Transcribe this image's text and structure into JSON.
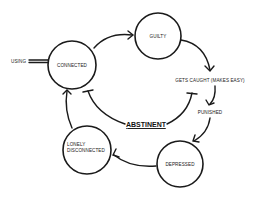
{
  "diagram": {
    "nodes": [
      {
        "id": "connected",
        "label": "CONNECTED",
        "shape": "circle"
      },
      {
        "id": "guilty",
        "label": "GUILTY",
        "shape": "circle"
      },
      {
        "id": "gets_caught",
        "label": "GETS CAUGHT (MAKES EASY)",
        "shape": "text"
      },
      {
        "id": "punished",
        "label": "PUNISHED",
        "shape": "text"
      },
      {
        "id": "depressed",
        "label": "DEPRESSED",
        "shape": "circle"
      },
      {
        "id": "lonely",
        "label_line1": "LONELY",
        "label_line2": "DISCONNECTED",
        "shape": "circle"
      }
    ],
    "center_label": "ABSTINENT",
    "input_label": "USING",
    "edges": [
      {
        "from": "using",
        "to": "connected",
        "type": "double-line"
      },
      {
        "from": "connected",
        "to": "guilty",
        "type": "arrow"
      },
      {
        "from": "guilty",
        "to": "gets_caught",
        "type": "arrow"
      },
      {
        "from": "gets_caught",
        "to": "punished",
        "type": "arrow"
      },
      {
        "from": "punished",
        "to": "depressed",
        "type": "arrow"
      },
      {
        "from": "depressed",
        "to": "lonely",
        "type": "arrow"
      },
      {
        "from": "lonely",
        "to": "connected",
        "type": "arrow"
      },
      {
        "from": "abstinent",
        "to": "connected",
        "type": "inhibit"
      },
      {
        "from": "abstinent",
        "to": "gets_caught",
        "type": "inhibit"
      }
    ]
  }
}
